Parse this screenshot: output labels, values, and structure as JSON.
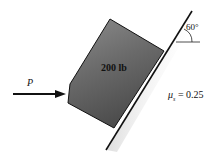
{
  "diagram": {
    "type": "inclined-plane-statics",
    "block": {
      "label": "200 lb",
      "fill_top": "#8a8a8a",
      "fill_bottom": "#4a4a4a"
    },
    "applied_force": {
      "label": "P",
      "direction": "horizontal-right"
    },
    "incline": {
      "angle_label": "60°"
    },
    "friction": {
      "symbol": "μ",
      "subscript": "s",
      "equals": "= 0.25"
    }
  }
}
